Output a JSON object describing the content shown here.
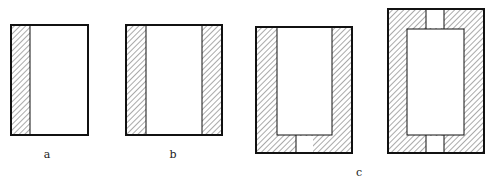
{
  "figure": {
    "labels": {
      "a": "a",
      "b": "b",
      "c": "c"
    },
    "colors": {
      "stroke": "#111111",
      "hatch": "#555555",
      "background": "#ffffff"
    },
    "panels": [
      {
        "id": "a",
        "description": "rectangle with hatched strip on left side"
      },
      {
        "id": "b",
        "description": "rectangle with hatched strips on left and right sides"
      },
      {
        "id": "c1",
        "description": "rectangle with U-shaped hatched border (sides and bottom) with gap at bottom center"
      },
      {
        "id": "c2",
        "description": "rectangle with full hatched border with gaps at top center and bottom center"
      }
    ]
  }
}
